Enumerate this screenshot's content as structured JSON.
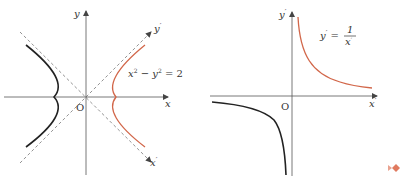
{
  "colors": {
    "axis": "#555555",
    "asymptote": "#777777",
    "curve_black": "#222222",
    "curve_orange": "#d2674a",
    "nav_marker": "#e07a5f"
  },
  "left_figure": {
    "axis_x_label": "x",
    "axis_y_label": "y",
    "rotated_x_label": "x",
    "rotated_x_prime": "′",
    "rotated_y_label": "y",
    "rotated_y_prime": "′",
    "origin_label": "O",
    "equation": {
      "x": "x",
      "x_exp": "2",
      "minus": " − ",
      "y": "y",
      "y_exp": "2",
      "equals": " = 2"
    }
  },
  "right_figure": {
    "axis_x_label": "x",
    "axis_x_prime": "′",
    "axis_y_label": "y",
    "axis_y_prime": "′",
    "origin_label": "O",
    "equation": {
      "lhs": "y",
      "lhs_prime": "′",
      "equals": " = ",
      "numerator": "1",
      "denominator": "x",
      "denominator_prime": "′"
    }
  }
}
